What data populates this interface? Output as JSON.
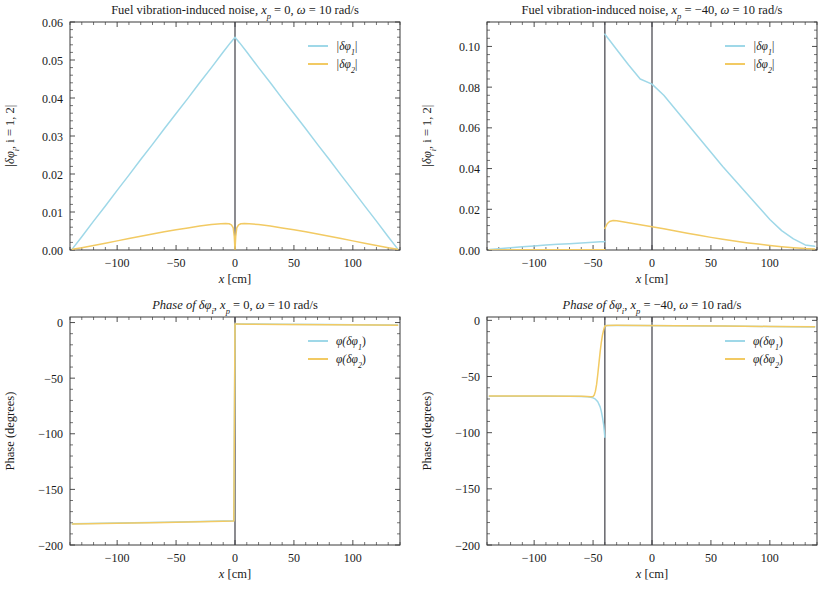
{
  "figure": {
    "panel_count": 4,
    "background": "#ffffff",
    "colors": {
      "series1": "#9fd8e8",
      "series2": "#f2ca63",
      "axis": "#3a3a3a",
      "vline": "#3f3f46",
      "text": "#1a1a1a"
    }
  },
  "chart_data": [
    {
      "id": "panel-top-left",
      "type": "line",
      "title": "Fuel vibration-induced noise, x_p = 0, ω = 10 rad/s",
      "title_parts": {
        "prefix": "Fuel vibration-induced noise, ",
        "var": "x",
        "sub": "p",
        "mid": " = 0, ",
        "omega": "ω",
        "suffix": " = 10 rad/s"
      },
      "xlabel": "x [cm]",
      "ylabel": "|δφᵢ, i = 1, 2|",
      "ylabel_parts": {
        "pre": "|δφ",
        "sub": "i",
        "post": ", i = 1, 2|"
      },
      "xlim": [
        -140,
        140
      ],
      "ylim": [
        0.0,
        0.06
      ],
      "xticks": [
        -100,
        -50,
        0,
        50,
        100
      ],
      "xtick_labels": [
        "−100",
        "−50",
        "0",
        "50",
        "100"
      ],
      "yticks": [
        0.0,
        0.01,
        0.02,
        0.03,
        0.04,
        0.05,
        0.06
      ],
      "ytick_labels": [
        "0.00",
        "0.01",
        "0.02",
        "0.03",
        "0.04",
        "0.05",
        "0.06"
      ],
      "grid": false,
      "legend_position": "top-right",
      "vertical_lines": [
        0
      ],
      "legend": [
        {
          "label": "|δφ₁|",
          "label_parts": {
            "pre": "|δφ",
            "sub": "1",
            "post": "|"
          },
          "color": "#9fd8e8"
        },
        {
          "label": "|δφ₂|",
          "label_parts": {
            "pre": "|δφ",
            "sub": "2",
            "post": "|"
          },
          "color": "#f2ca63"
        }
      ],
      "series": [
        {
          "name": "|δφ₁|",
          "color": "#9fd8e8",
          "x": [
            -138,
            -130,
            -120,
            -110,
            -100,
            -90,
            -80,
            -70,
            -60,
            -50,
            -40,
            -30,
            -20,
            -10,
            -4,
            -1,
            0,
            1,
            4,
            10,
            20,
            30,
            40,
            50,
            60,
            70,
            80,
            90,
            100,
            110,
            120,
            130,
            138
          ],
          "y": [
            0.0003,
            0.0035,
            0.0076,
            0.0116,
            0.0157,
            0.0197,
            0.0238,
            0.0278,
            0.0319,
            0.0359,
            0.0399,
            0.044,
            0.048,
            0.0521,
            0.0545,
            0.0556,
            0.056,
            0.0556,
            0.0545,
            0.0521,
            0.048,
            0.044,
            0.0399,
            0.0359,
            0.0319,
            0.0278,
            0.0238,
            0.0197,
            0.0157,
            0.0116,
            0.0076,
            0.0035,
            0.0003
          ]
        },
        {
          "name": "|δφ₂|",
          "color": "#f2ca63",
          "x": [
            -138,
            -130,
            -120,
            -110,
            -100,
            -90,
            -80,
            -70,
            -60,
            -50,
            -40,
            -30,
            -20,
            -12,
            -8,
            -5,
            -3,
            -1.5,
            -0.6,
            0,
            0.6,
            1.5,
            3,
            5,
            8,
            12,
            20,
            30,
            40,
            50,
            60,
            70,
            80,
            90,
            100,
            110,
            120,
            130,
            138
          ],
          "y": [
            0.0002,
            0.0006,
            0.0012,
            0.0018,
            0.0024,
            0.003,
            0.0036,
            0.0042,
            0.0048,
            0.0053,
            0.0058,
            0.0063,
            0.0067,
            0.0069,
            0.00695,
            0.0069,
            0.0066,
            0.0058,
            0.0035,
            0.0,
            0.0035,
            0.0058,
            0.0066,
            0.0069,
            0.00695,
            0.0069,
            0.0067,
            0.0063,
            0.0058,
            0.0053,
            0.0048,
            0.0042,
            0.0036,
            0.003,
            0.0024,
            0.0018,
            0.0012,
            0.0006,
            0.0002
          ]
        }
      ]
    },
    {
      "id": "panel-top-right",
      "type": "line",
      "title": "Fuel vibration-induced noise, x_p = −40, ω = 10 rad/s",
      "title_parts": {
        "prefix": "Fuel vibration-induced noise, ",
        "var": "x",
        "sub": "p",
        "mid": " = −40, ",
        "omega": "ω",
        "suffix": " = 10 rad/s"
      },
      "xlabel": "x [cm]",
      "ylabel": "|δφᵢ, i = 1, 2|",
      "ylabel_parts": {
        "pre": "|δφ",
        "sub": "i",
        "post": ", i = 1, 2|"
      },
      "xlim": [
        -140,
        140
      ],
      "ylim": [
        0.0,
        0.112
      ],
      "xticks": [
        -100,
        -50,
        0,
        50,
        100
      ],
      "xtick_labels": [
        "−100",
        "−50",
        "0",
        "50",
        "100"
      ],
      "yticks": [
        0.0,
        0.02,
        0.04,
        0.06,
        0.08,
        0.1
      ],
      "ytick_labels": [
        "0.00",
        "0.02",
        "0.04",
        "0.06",
        "0.08",
        "0.10"
      ],
      "grid": false,
      "legend_position": "top-right",
      "vertical_lines": [
        -40,
        0
      ],
      "legend": [
        {
          "label": "|δφ₁|",
          "label_parts": {
            "pre": "|δφ",
            "sub": "1",
            "post": "|"
          },
          "color": "#9fd8e8"
        },
        {
          "label": "|δφ₂|",
          "label_parts": {
            "pre": "|δφ",
            "sub": "2",
            "post": "|"
          },
          "color": "#f2ca63"
        }
      ],
      "series": [
        {
          "name": "|δφ₁|",
          "color": "#9fd8e8",
          "x": [
            -138,
            -130,
            -120,
            -110,
            -100,
            -90,
            -80,
            -70,
            -60,
            -50,
            -44,
            -41,
            -40,
            -40,
            -36,
            -30,
            -20,
            -10,
            0,
            10,
            20,
            30,
            40,
            50,
            60,
            70,
            80,
            90,
            100,
            110,
            120,
            130,
            138
          ],
          "y": [
            0.0002,
            0.0006,
            0.0011,
            0.0016,
            0.002,
            0.0024,
            0.0028,
            0.0031,
            0.0035,
            0.0038,
            0.004,
            0.0041,
            0.0042,
            0.106,
            0.103,
            0.0985,
            0.091,
            0.084,
            0.0815,
            0.076,
            0.069,
            0.062,
            0.055,
            0.048,
            0.041,
            0.0345,
            0.028,
            0.0215,
            0.015,
            0.0095,
            0.0055,
            0.0025,
            0.0018
          ]
        },
        {
          "name": "|δφ₂|",
          "color": "#f2ca63",
          "x": [
            -138,
            -120,
            -100,
            -80,
            -60,
            -50,
            -44,
            -41,
            -40,
            -40,
            -38,
            -36,
            -33,
            -30,
            -25,
            -20,
            -10,
            0,
            10,
            20,
            30,
            40,
            50,
            60,
            70,
            80,
            90,
            100,
            110,
            120,
            130,
            138
          ],
          "y": [
            5e-05,
            8e-05,
            0.0001,
            0.00012,
            0.00015,
            0.00016,
            0.00017,
            0.00017,
            0.00018,
            0.0106,
            0.0129,
            0.014,
            0.0145,
            0.0144,
            0.0139,
            0.0134,
            0.0124,
            0.0114,
            0.0104,
            0.0093,
            0.0082,
            0.0072,
            0.0062,
            0.0053,
            0.0044,
            0.0036,
            0.0029,
            0.0022,
            0.0016,
            0.0011,
            0.0007,
            0.0005
          ]
        }
      ]
    },
    {
      "id": "panel-bottom-left",
      "type": "line",
      "title": "Phase of δφᵢ, x_p = 0, ω = 10 rad/s",
      "title_parts": {
        "prefix": "Phase of δφ",
        "prefix_sub": "i",
        "mid_pre": ", ",
        "var": "x",
        "sub": "p",
        "mid": " = 0, ",
        "omega": "ω",
        "suffix": " = 10 rad/s"
      },
      "xlabel": "x [cm]",
      "ylabel": "Phase (degrees)",
      "xlim": [
        -140,
        140
      ],
      "ylim": [
        -200,
        5
      ],
      "xticks": [
        -100,
        -50,
        0,
        50,
        100
      ],
      "xtick_labels": [
        "−100",
        "−50",
        "0",
        "50",
        "100"
      ],
      "yticks": [
        0,
        -50,
        -100,
        -150,
        -200
      ],
      "ytick_labels": [
        "0",
        "−50",
        "−100",
        "−150",
        "−200"
      ],
      "grid": false,
      "legend_position": "top-right",
      "vertical_lines": [
        0
      ],
      "legend": [
        {
          "label": "φ(δφ₁)",
          "label_parts": {
            "pre": "φ(δφ",
            "sub": "1",
            "post": ")"
          },
          "color": "#9fd8e8"
        },
        {
          "label": "φ(δφ₂)",
          "label_parts": {
            "pre": "φ(δφ",
            "sub": "2",
            "post": ")"
          },
          "color": "#f2ca63"
        }
      ],
      "series": [
        {
          "name": "φ(δφ₁)",
          "color": "#9fd8e8",
          "x": [
            -138,
            -100,
            -60,
            -30,
            -10,
            -1,
            0,
            1,
            10,
            40,
            80,
            120,
            138
          ],
          "y": [
            -181.0,
            -180.3,
            -179.5,
            -178.9,
            -178.4,
            -178.2,
            -1.2,
            -1.2,
            -1.3,
            -1.5,
            -1.8,
            -2.1,
            -2.2
          ]
        },
        {
          "name": "φ(δφ₂)",
          "color": "#f2ca63",
          "x": [
            -138,
            -100,
            -60,
            -30,
            -10,
            -1,
            0,
            1,
            10,
            40,
            80,
            120,
            138
          ],
          "y": [
            -181.2,
            -180.5,
            -179.7,
            -179.1,
            -178.6,
            -178.4,
            -1.4,
            -1.4,
            -1.5,
            -1.7,
            -2.0,
            -2.3,
            -2.4
          ]
        }
      ]
    },
    {
      "id": "panel-bottom-right",
      "type": "line",
      "title": "Phase of δφᵢ, x_p = −40, ω = 10 rad/s",
      "title_parts": {
        "prefix": "Phase of δφ",
        "prefix_sub": "i",
        "mid_pre": ", ",
        "var": "x",
        "sub": "p",
        "mid": " = −40, ",
        "omega": "ω",
        "suffix": " = 10 rad/s"
      },
      "xlabel": "x [cm]",
      "ylabel": "Phase (degrees)",
      "xlim": [
        -140,
        140
      ],
      "ylim": [
        -200,
        3
      ],
      "xticks": [
        -100,
        -50,
        0,
        50,
        100
      ],
      "xtick_labels": [
        "−100",
        "−50",
        "0",
        "50",
        "100"
      ],
      "yticks": [
        0,
        -50,
        -100,
        -150,
        -200
      ],
      "ytick_labels": [
        "0",
        "−50",
        "−100",
        "−150",
        "−200"
      ],
      "grid": false,
      "legend_position": "top-right",
      "vertical_lines": [
        -40,
        0
      ],
      "legend": [
        {
          "label": "φ(δφ₁)",
          "label_parts": {
            "pre": "φ(δφ",
            "sub": "1",
            "post": ")"
          },
          "color": "#9fd8e8"
        },
        {
          "label": "φ(δφ₂)",
          "label_parts": {
            "pre": "φ(δφ",
            "sub": "2",
            "post": ")"
          },
          "color": "#f2ca63"
        }
      ],
      "series": [
        {
          "name": "φ(δφ₁)",
          "color": "#9fd8e8",
          "x": [
            -138,
            -110,
            -90,
            -70,
            -60,
            -55,
            -52,
            -50,
            -48,
            -46,
            -44,
            -43,
            -42,
            -41,
            -40.5,
            -40,
            -40,
            -38,
            -30,
            -10,
            20,
            60,
            100,
            138
          ],
          "y": [
            -67.5,
            -67.5,
            -67.5,
            -67.6,
            -67.7,
            -68.0,
            -68.4,
            -69.0,
            -70.2,
            -72.5,
            -77.0,
            -81.0,
            -86.5,
            -93.0,
            -98.5,
            -104.0,
            -5.0,
            -4.6,
            -4.5,
            -4.6,
            -4.8,
            -5.1,
            -5.5,
            -5.8
          ]
        },
        {
          "name": "φ(δφ₂)",
          "color": "#f2ca63",
          "x": [
            -138,
            -110,
            -90,
            -70,
            -60,
            -55,
            -52,
            -50,
            -49,
            -48,
            -47,
            -46,
            -45,
            -44,
            -43,
            -42,
            -41,
            -40.5,
            -40,
            -38,
            -30,
            -10,
            20,
            60,
            100,
            138
          ],
          "y": [
            -67.4,
            -67.4,
            -67.4,
            -67.5,
            -67.6,
            -67.8,
            -68.0,
            -67.8,
            -66.5,
            -63.0,
            -57.0,
            -48.0,
            -38.0,
            -28.0,
            -19.5,
            -13.0,
            -8.5,
            -6.5,
            -5.0,
            -4.5,
            -4.4,
            -4.5,
            -4.7,
            -5.0,
            -5.4,
            -5.7
          ]
        }
      ]
    }
  ]
}
